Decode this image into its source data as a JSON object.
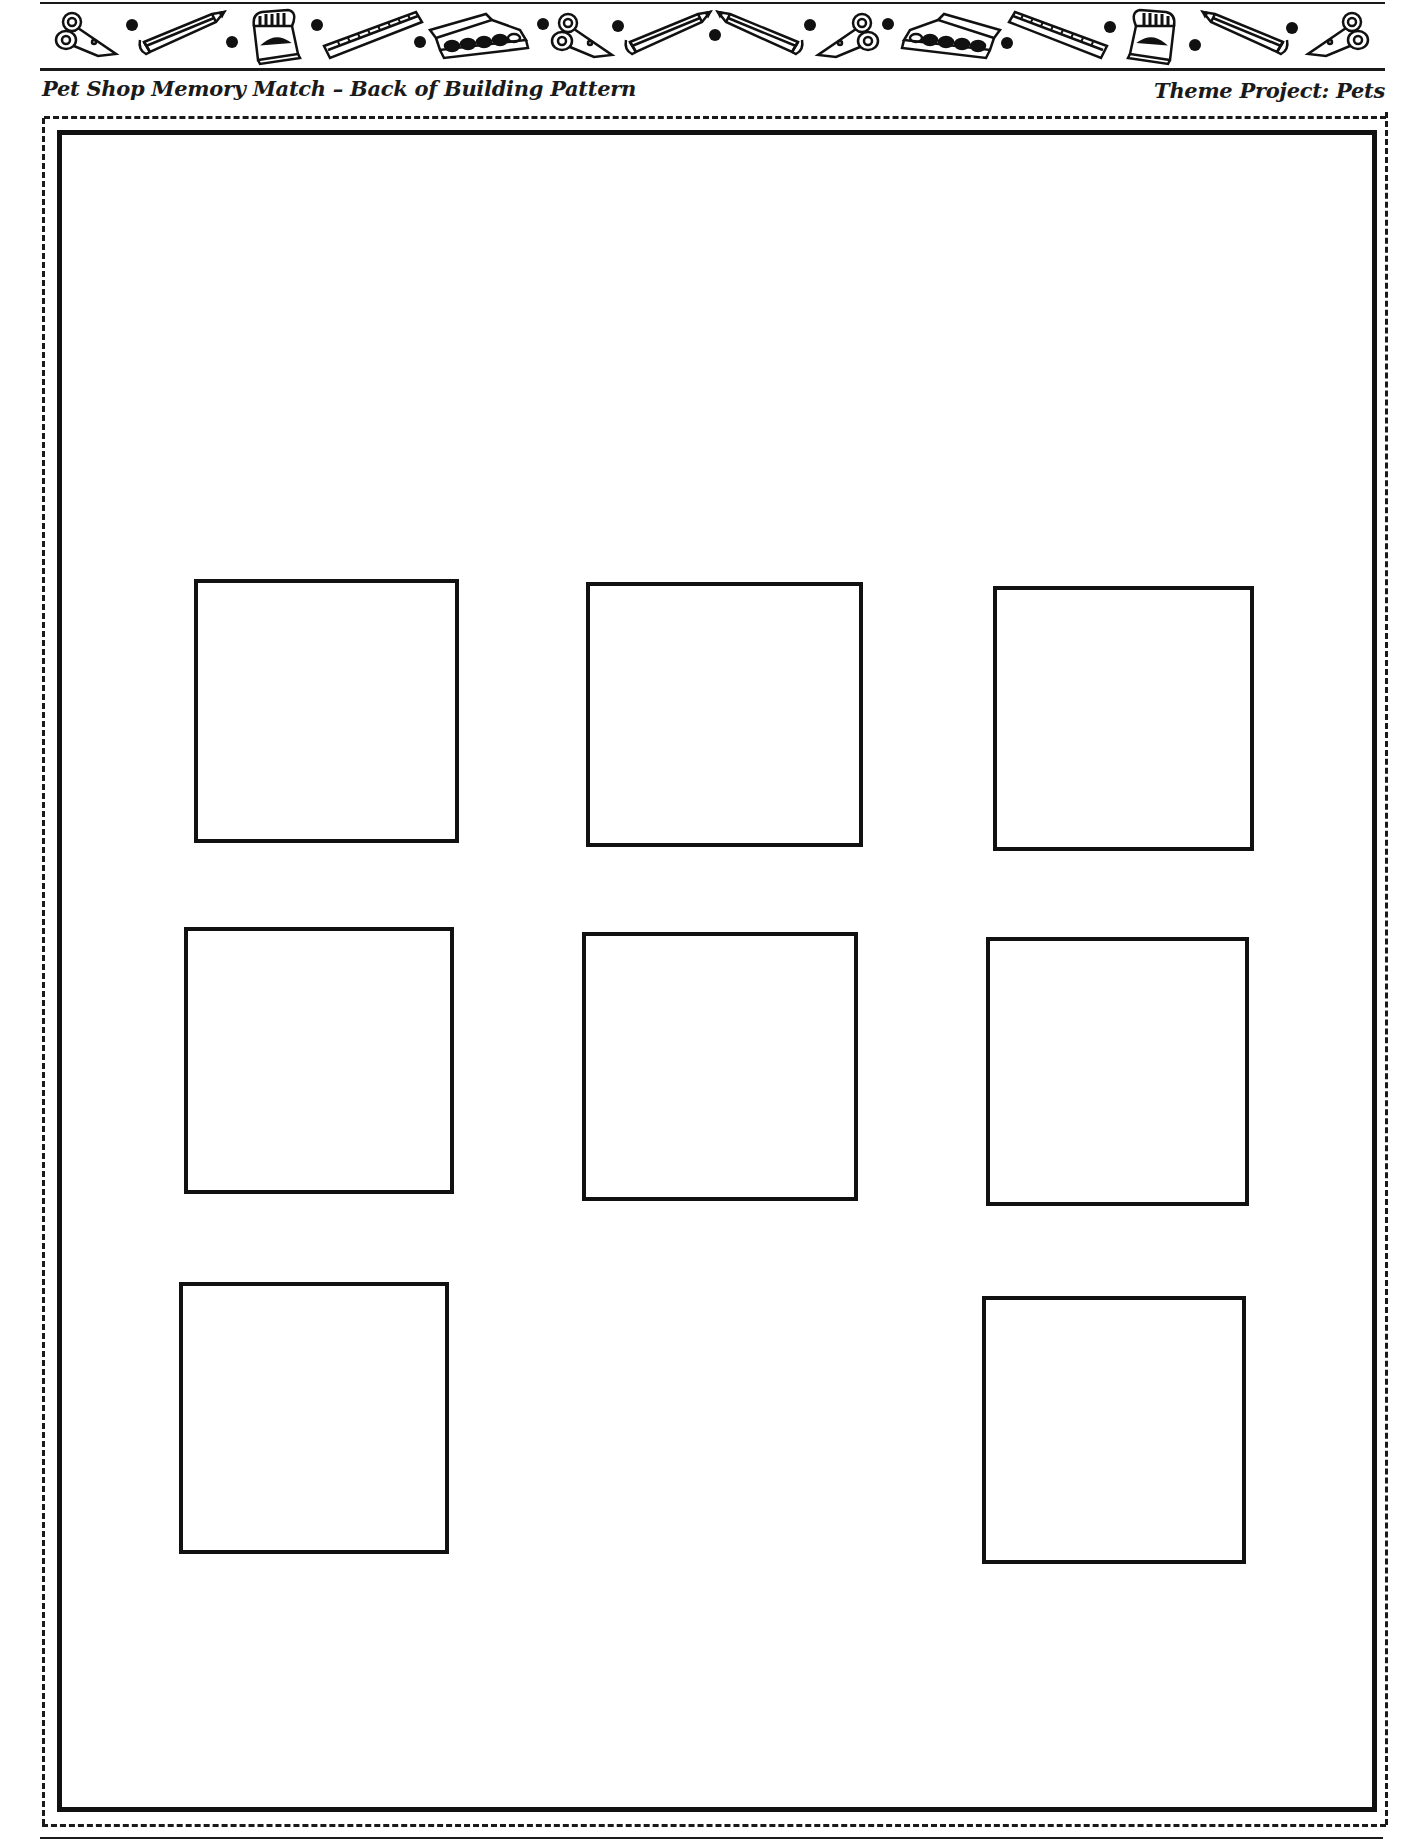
{
  "header": {
    "title": "Pet Shop Memory Match – Back of Building Pattern",
    "theme": "Theme Project: Pets"
  },
  "banner": {
    "icons": [
      "scissors-icon",
      "dot",
      "pencil-icon",
      "dot",
      "crayon-box-icon",
      "dot",
      "ruler-icon",
      "dot",
      "paint-box-icon",
      "dot",
      "scissors-icon",
      "dot",
      "pencil-icon",
      "dot",
      "pencil-icon",
      "dot",
      "scissors-icon",
      "dot",
      "paint-box-icon",
      "dot",
      "ruler-icon",
      "dot",
      "crayon-box-icon",
      "dot",
      "pencil-icon",
      "dot",
      "scissors-icon"
    ]
  },
  "pattern": {
    "card_slots": [
      {
        "row": 1,
        "col": 1
      },
      {
        "row": 1,
        "col": 2
      },
      {
        "row": 1,
        "col": 3
      },
      {
        "row": 2,
        "col": 1
      },
      {
        "row": 2,
        "col": 2
      },
      {
        "row": 2,
        "col": 3
      },
      {
        "row": 3,
        "col": 1
      },
      {
        "row": 3,
        "col": 3
      }
    ]
  }
}
